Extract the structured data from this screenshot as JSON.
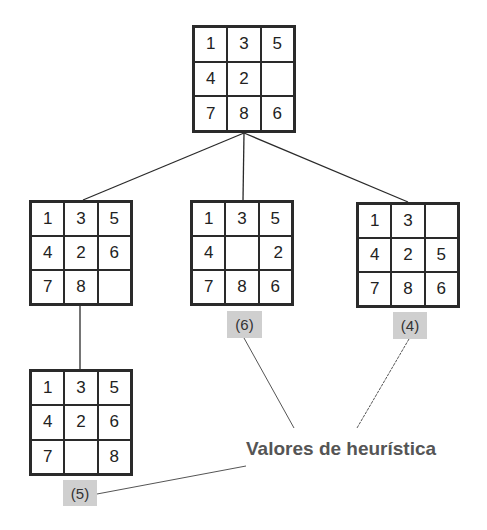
{
  "diagram": {
    "root": {
      "cells": [
        "1",
        "3",
        "5",
        "4",
        "2",
        "",
        "7",
        "8",
        "6"
      ]
    },
    "children": [
      {
        "id": "left",
        "cells": [
          "1",
          "3",
          "5",
          "4",
          "2",
          "6",
          "7",
          "8",
          ""
        ]
      },
      {
        "id": "middle",
        "cells": [
          "1",
          "3",
          "5",
          "4",
          "",
          "2",
          "7",
          "8",
          "6"
        ],
        "heuristic": "(6)"
      },
      {
        "id": "right",
        "cells": [
          "1",
          "3",
          "",
          "4",
          "2",
          "5",
          "7",
          "8",
          "6"
        ],
        "heuristic": "(4)"
      }
    ],
    "grandchild": {
      "parent": "left",
      "cells": [
        "1",
        "3",
        "5",
        "4",
        "2",
        "6",
        "7",
        "",
        "8"
      ],
      "heuristic": "(5)"
    },
    "caption": "Valores de heurística",
    "colors": {
      "line": "#2a2a2a",
      "badge_bg": "#cfcfcf",
      "caption": "#555555"
    }
  }
}
